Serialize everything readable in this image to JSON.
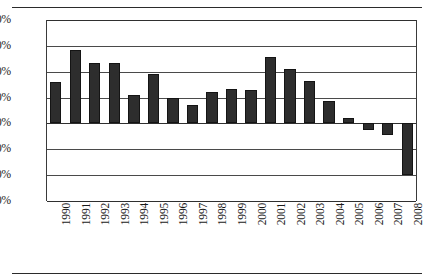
{
  "chart_data": {
    "type": "bar",
    "title": "",
    "subtitle": "",
    "xlabel": "",
    "ylabel": "",
    "orientation": "vertical",
    "grid": true,
    "legend": false,
    "legend_position": "none",
    "bar_color": "#2d2d2d",
    "ylim": [
      -30,
      40
    ],
    "ytick_step": 10,
    "yticks": [
      "40%",
      "30%",
      "20%",
      "10%",
      "0%",
      "-10%",
      "-20%",
      "-30%"
    ],
    "ytick_values": [
      40,
      30,
      20,
      10,
      0,
      -10,
      -20,
      -30
    ],
    "categories": [
      "1990",
      "1991",
      "1992",
      "1993",
      "1994",
      "1995",
      "1996",
      "1997",
      "1998",
      "1999",
      "2000",
      "2001",
      "2002",
      "2003",
      "2004",
      "2005",
      "2006",
      "2007",
      "2008"
    ],
    "values": [
      16,
      28.5,
      23.5,
      23.5,
      11,
      19,
      10,
      7,
      12,
      13.5,
      13,
      25.5,
      21,
      16.5,
      8.5,
      2,
      -2.5,
      -4.5,
      -20
    ],
    "value_unit": "%"
  },
  "figure": {
    "top_rule": "",
    "bottom_rule": ""
  }
}
